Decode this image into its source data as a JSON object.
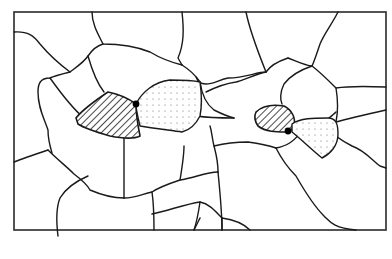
{
  "diagram": {
    "type": "grain-microstructure",
    "frame": {
      "x": 14,
      "y": 12,
      "width": 372,
      "height": 218
    },
    "colors": {
      "line": "#1a1a1a",
      "background": "#ffffff",
      "particle": "#000000",
      "dot_pattern": "#666666"
    },
    "regions": [
      {
        "id": "hatched-grain-left",
        "fill": "diagonal-hatch"
      },
      {
        "id": "dotted-grain-left",
        "fill": "dots"
      },
      {
        "id": "hatched-grain-right",
        "fill": "diagonal-hatch"
      },
      {
        "id": "dotted-grain-right",
        "fill": "dots"
      }
    ],
    "particles": [
      {
        "id": "particle-left",
        "cx": 136,
        "cy": 104
      },
      {
        "id": "particle-right",
        "cx": 288,
        "cy": 131
      }
    ]
  }
}
